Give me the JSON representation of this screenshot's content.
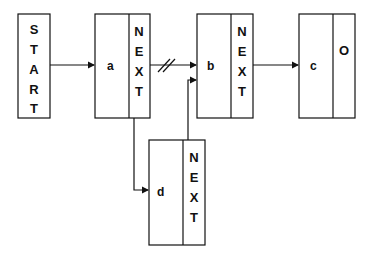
{
  "diagram": {
    "type": "linked-list-insertion",
    "start": {
      "label": "START",
      "letters": [
        "S",
        "T",
        "A",
        "R",
        "T"
      ]
    },
    "nodes": [
      {
        "id": "a",
        "data": "a",
        "pointer_letters": [
          "N",
          "E",
          "X",
          "T"
        ]
      },
      {
        "id": "b",
        "data": "b",
        "pointer_letters": [
          "N",
          "E",
          "X",
          "T"
        ]
      },
      {
        "id": "c",
        "data": "c",
        "pointer": "O"
      },
      {
        "id": "d",
        "data": "d",
        "pointer_letters": [
          "N",
          "E",
          "X",
          "T"
        ]
      }
    ],
    "edges": [
      {
        "from": "START",
        "to": "a"
      },
      {
        "from": "a.NEXT",
        "to": "b",
        "broken": true
      },
      {
        "from": "a.NEXT",
        "to": "d"
      },
      {
        "from": "d.NEXT",
        "to": "b"
      },
      {
        "from": "b.NEXT",
        "to": "c"
      }
    ],
    "colors": {
      "stroke": "#111111",
      "background": "#ffffff"
    }
  }
}
